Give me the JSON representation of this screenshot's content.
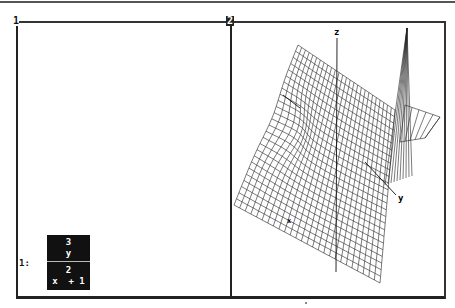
{
  "windows": [
    {
      "id": "1",
      "label": "1",
      "type": "algebra"
    },
    {
      "id": "2",
      "label": "2",
      "type": "3d-plot"
    }
  ],
  "algebra": {
    "entries": [
      {
        "label": "1:",
        "numerator": [
          "3",
          "y"
        ],
        "denominator": [
          "2",
          "x  + 1"
        ],
        "selected": true
      }
    ]
  },
  "plot3d": {
    "axes": {
      "x": "x",
      "y": "y",
      "z": "z"
    },
    "surface": "wireframe mesh of y^3/(x^2+1)"
  }
}
